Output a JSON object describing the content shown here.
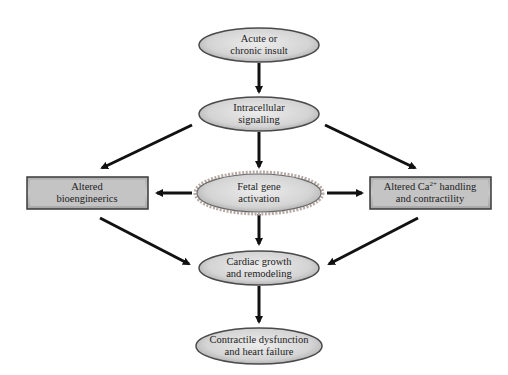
{
  "diagram": {
    "type": "flowchart",
    "colors": {
      "ellipse_fill": "#d6d6d6",
      "ellipse_stroke": "#4a4a4a",
      "fetal_stroke": "#a89a94",
      "box_fill": "#bdbdbd",
      "box_stroke": "#3a3a3a",
      "arrow": "#111111",
      "text": "#222222"
    },
    "nodes": {
      "insult": {
        "line1": "Acute or",
        "line2": "chronic insult",
        "shape": "ellipse"
      },
      "signalling": {
        "line1": "Intracellular",
        "line2": "signalling",
        "shape": "ellipse"
      },
      "fetal": {
        "line1": "Fetal gene",
        "line2": "activation",
        "shape": "ellipse"
      },
      "bioenergetics": {
        "line1": "Altered",
        "line2": "bioengineerics",
        "shape": "box"
      },
      "calcium": {
        "line1": "Altered Ca",
        "line1_sup": "2+",
        "line1_rest": " handling",
        "line2": "and contractility",
        "shape": "box"
      },
      "remodeling": {
        "line1": "Cardiac growth",
        "line2": "and remodeling",
        "shape": "ellipse"
      },
      "failure": {
        "line1": "Contractile dysfunction",
        "line2": "and heart failure",
        "shape": "ellipse"
      }
    },
    "edges": [
      {
        "from": "insult",
        "to": "signalling"
      },
      {
        "from": "signalling",
        "to": "fetal"
      },
      {
        "from": "signalling",
        "to": "bioenergetics"
      },
      {
        "from": "signalling",
        "to": "calcium"
      },
      {
        "from": "fetal",
        "to": "bioenergetics"
      },
      {
        "from": "fetal",
        "to": "calcium"
      },
      {
        "from": "fetal",
        "to": "remodeling"
      },
      {
        "from": "bioenergetics",
        "to": "remodeling"
      },
      {
        "from": "calcium",
        "to": "remodeling"
      },
      {
        "from": "remodeling",
        "to": "failure"
      }
    ]
  }
}
